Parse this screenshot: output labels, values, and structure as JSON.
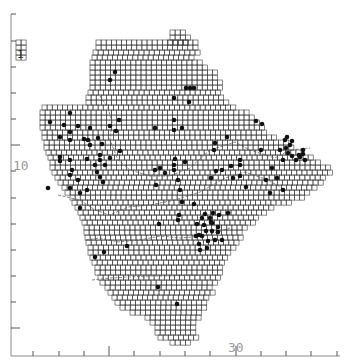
{
  "map": {
    "title": "",
    "cell_size": 5.1,
    "colors": {
      "grid": "#3a3a3a",
      "dot": "#111111",
      "axis": "#8a8a8a"
    },
    "axis_labels": {
      "y_label": "10",
      "x_label": "30",
      "inset_label": "1"
    },
    "y_ticks": [
      14,
      41,
      67,
      93,
      119,
      145,
      171,
      198,
      224,
      250,
      276,
      302,
      328
    ],
    "x_ticks": [
      33,
      59,
      84,
      109,
      134,
      160,
      185,
      210,
      236,
      261,
      286,
      311,
      337
    ],
    "grid_rows": [
      {
        "y": 30,
        "x0": 170,
        "x1": 185
      },
      {
        "y": 35,
        "x0": 170,
        "x1": 190
      },
      {
        "y": 40,
        "x0": 96,
        "x1": 195,
        "extra": [
          [
            168,
            188
          ]
        ]
      },
      {
        "y": 45,
        "x0": 96,
        "x1": 195
      },
      {
        "y": 50,
        "x0": 93,
        "x1": 195
      },
      {
        "y": 55,
        "x0": 92,
        "x1": 190
      },
      {
        "y": 60,
        "x0": 90,
        "x1": 200
      },
      {
        "y": 65,
        "x0": 90,
        "x1": 205
      },
      {
        "y": 70,
        "x0": 90,
        "x1": 215
      },
      {
        "y": 75,
        "x0": 90,
        "x1": 215
      },
      {
        "y": 80,
        "x0": 90,
        "x1": 218
      },
      {
        "y": 85,
        "x0": 90,
        "x1": 218
      },
      {
        "y": 90,
        "x0": 88,
        "x1": 220
      },
      {
        "y": 95,
        "x0": 86,
        "x1": 222
      },
      {
        "y": 100,
        "x0": 86,
        "x1": 225
      },
      {
        "y": 105,
        "x0": 42,
        "x1": 235
      },
      {
        "y": 110,
        "x0": 40,
        "x1": 245
      },
      {
        "y": 115,
        "x0": 40,
        "x1": 250
      },
      {
        "y": 120,
        "x0": 40,
        "x1": 255
      },
      {
        "y": 125,
        "x0": 40,
        "x1": 260
      },
      {
        "y": 130,
        "x0": 42,
        "x1": 265
      },
      {
        "y": 135,
        "x0": 42,
        "x1": 275
      },
      {
        "y": 140,
        "x0": 44,
        "x1": 285
      },
      {
        "y": 145,
        "x0": 44,
        "x1": 292
      },
      {
        "y": 150,
        "x0": 46,
        "x1": 300
      },
      {
        "y": 155,
        "x0": 48,
        "x1": 312
      },
      {
        "y": 160,
        "x0": 50,
        "x1": 320
      },
      {
        "y": 165,
        "x0": 50,
        "x1": 330
      },
      {
        "y": 170,
        "x0": 52,
        "x1": 330
      },
      {
        "y": 175,
        "x0": 55,
        "x1": 325
      },
      {
        "y": 180,
        "x0": 58,
        "x1": 322
      },
      {
        "y": 185,
        "x0": 62,
        "x1": 315
      },
      {
        "y": 190,
        "x0": 65,
        "x1": 308
      },
      {
        "y": 195,
        "x0": 70,
        "x1": 300
      },
      {
        "y": 200,
        "x0": 72,
        "x1": 290
      },
      {
        "y": 205,
        "x0": 75,
        "x1": 270
      },
      {
        "y": 210,
        "x0": 78,
        "x1": 262
      },
      {
        "y": 215,
        "x0": 80,
        "x1": 258
      },
      {
        "y": 220,
        "x0": 82,
        "x1": 252
      },
      {
        "y": 225,
        "x0": 84,
        "x1": 245
      },
      {
        "y": 230,
        "x0": 84,
        "x1": 240
      },
      {
        "y": 235,
        "x0": 85,
        "x1": 238
      },
      {
        "y": 240,
        "x0": 86,
        "x1": 235
      },
      {
        "y": 245,
        "x0": 88,
        "x1": 232
      },
      {
        "y": 250,
        "x0": 88,
        "x1": 228
      },
      {
        "y": 255,
        "x0": 90,
        "x1": 225
      },
      {
        "y": 260,
        "x0": 92,
        "x1": 222
      },
      {
        "y": 265,
        "x0": 95,
        "x1": 220
      },
      {
        "y": 270,
        "x0": 95,
        "x1": 218
      },
      {
        "y": 275,
        "x0": 98,
        "x1": 216
      },
      {
        "y": 280,
        "x0": 100,
        "x1": 214
      },
      {
        "y": 285,
        "x0": 105,
        "x1": 212
      },
      {
        "y": 290,
        "x0": 108,
        "x1": 210
      },
      {
        "y": 295,
        "x0": 112,
        "x1": 208
      },
      {
        "y": 300,
        "x0": 115,
        "x1": 206
      },
      {
        "y": 305,
        "x0": 120,
        "x1": 204
      },
      {
        "y": 310,
        "x0": 130,
        "x1": 200
      },
      {
        "y": 315,
        "x0": 145,
        "x1": 196
      },
      {
        "y": 320,
        "x0": 150,
        "x1": 194
      },
      {
        "y": 325,
        "x0": 155,
        "x1": 194
      },
      {
        "y": 330,
        "x0": 155,
        "x1": 194
      },
      {
        "y": 335,
        "x0": 158,
        "x1": 194
      },
      {
        "y": 340,
        "x0": 170,
        "x1": 190
      }
    ],
    "inset_cells": [
      [
        16,
        40
      ],
      [
        21,
        40
      ],
      [
        16,
        45
      ],
      [
        21,
        45
      ],
      [
        16,
        50
      ],
      [
        21,
        50
      ],
      [
        16,
        55
      ],
      [
        21,
        55
      ]
    ],
    "dots": [
      [
        115,
        72
      ],
      [
        110,
        80
      ],
      [
        186,
        88
      ],
      [
        190,
        88
      ],
      [
        194,
        88
      ],
      [
        174,
        98
      ],
      [
        189,
        102
      ],
      [
        70,
        113
      ],
      [
        50,
        122
      ],
      [
        64,
        125
      ],
      [
        78,
        126
      ],
      [
        90,
        128
      ],
      [
        110,
        126
      ],
      [
        119,
        120
      ],
      [
        174,
        120
      ],
      [
        174,
        130
      ],
      [
        182,
        128
      ],
      [
        60,
        137
      ],
      [
        70,
        132
      ],
      [
        84,
        139
      ],
      [
        98,
        138
      ],
      [
        116,
        131
      ],
      [
        155,
        128
      ],
      [
        256,
        121
      ],
      [
        262,
        124
      ],
      [
        70,
        140
      ],
      [
        88,
        140
      ],
      [
        90,
        145
      ],
      [
        102,
        144
      ],
      [
        120,
        151
      ],
      [
        215,
        143
      ],
      [
        227,
        137
      ],
      [
        286,
        148
      ],
      [
        261,
        150
      ],
      [
        60,
        157
      ],
      [
        87,
        159
      ],
      [
        100,
        155
      ],
      [
        110,
        158
      ],
      [
        214,
        150
      ],
      [
        175,
        159
      ],
      [
        174,
        170
      ],
      [
        60,
        161
      ],
      [
        70,
        160
      ],
      [
        72,
        170
      ],
      [
        95,
        165
      ],
      [
        100,
        160
      ],
      [
        105,
        165
      ],
      [
        185,
        162
      ],
      [
        240,
        165
      ],
      [
        280,
        150
      ],
      [
        288,
        153
      ],
      [
        292,
        156
      ],
      [
        296,
        160
      ],
      [
        300,
        157
      ],
      [
        303,
        154
      ],
      [
        305,
        160
      ],
      [
        283,
        160
      ],
      [
        70,
        175
      ],
      [
        78,
        180
      ],
      [
        97,
        172
      ],
      [
        100,
        177
      ],
      [
        103,
        182
      ],
      [
        155,
        170
      ],
      [
        160,
        168
      ],
      [
        165,
        173
      ],
      [
        231,
        166
      ],
      [
        240,
        160
      ],
      [
        285,
        140
      ],
      [
        290,
        145
      ],
      [
        292,
        141
      ],
      [
        287,
        137
      ],
      [
        299,
        155
      ],
      [
        303,
        150
      ],
      [
        70,
        188
      ],
      [
        87,
        190
      ],
      [
        156,
        185
      ],
      [
        174,
        165
      ],
      [
        178,
        180
      ],
      [
        180,
        190
      ],
      [
        211,
        178
      ],
      [
        216,
        171
      ],
      [
        222,
        170
      ],
      [
        233,
        178
      ],
      [
        240,
        176
      ],
      [
        246,
        187
      ],
      [
        266,
        180
      ],
      [
        272,
        168
      ],
      [
        277,
        178
      ],
      [
        283,
        190
      ],
      [
        270,
        193
      ],
      [
        182,
        202
      ],
      [
        194,
        204
      ],
      [
        48,
        188
      ],
      [
        80,
        193
      ],
      [
        80,
        208
      ],
      [
        179,
        215
      ],
      [
        178,
        220
      ],
      [
        205,
        214
      ],
      [
        213,
        213
      ],
      [
        202,
        218
      ],
      [
        210,
        218
      ],
      [
        219,
        215
      ],
      [
        197,
        224
      ],
      [
        204,
        225
      ],
      [
        212,
        223
      ],
      [
        218,
        227
      ],
      [
        206,
        231
      ],
      [
        212,
        231
      ],
      [
        218,
        232
      ],
      [
        196,
        236
      ],
      [
        202,
        236
      ],
      [
        208,
        241
      ],
      [
        215,
        240
      ],
      [
        222,
        240
      ],
      [
        199,
        244
      ],
      [
        207,
        248
      ],
      [
        200,
        250
      ],
      [
        199,
        235
      ],
      [
        228,
        213
      ],
      [
        211,
        222
      ],
      [
        127,
        246
      ],
      [
        104,
        252
      ],
      [
        95,
        257
      ],
      [
        158,
        287
      ],
      [
        177,
        304
      ],
      [
        159,
        224
      ]
    ],
    "rivers": [
      "M100,96 L108,108 L112,122 L110,140 L118,160 L130,170 L150,176 L170,176 L190,168 L210,150 L235,142 L250,150 L275,158 L290,150 L310,148",
      "M58,195 L80,200 L95,210 L110,215 L128,207 L150,205 L175,200 L200,192 L225,178 L245,172 L268,180 L282,188",
      "M86,240 L100,238 L118,242 L140,240 L160,236 L180,238 L205,236 L230,228",
      "M92,280 L110,278 L130,277 L150,276 L170,276 L200,275"
    ]
  }
}
